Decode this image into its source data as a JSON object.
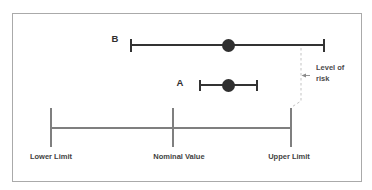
{
  "figure": {
    "measurements": [
      {
        "label": "B"
      },
      {
        "label": "A"
      }
    ],
    "risk_annotation": {
      "line1": "Level of",
      "line2": "risk"
    },
    "axis": {
      "lower_label": "Lower Limit",
      "nominal_label": "Nominal Value",
      "upper_label": "Upper Limit"
    },
    "colors": {
      "error_bar": "#333333",
      "marker": "#2f2f2f",
      "scale_line": "#7f7f7f",
      "dashed_line": "#c3c3c3",
      "arrow": "#8a8a8a",
      "text": "#3f3f3f",
      "panel_border": "#aaaaaa"
    }
  }
}
